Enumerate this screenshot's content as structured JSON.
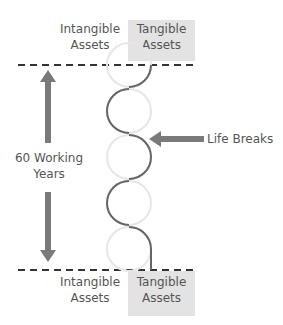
{
  "top_labels": {
    "intangible": [
      "Intangible",
      "Assets"
    ],
    "tangible": [
      "Tangible",
      "Assets"
    ]
  },
  "bottom_labels": {
    "intangible": [
      "Intangible",
      "Assets"
    ],
    "tangible": [
      "Tangible",
      "Assets"
    ]
  },
  "side_label": [
    "60 Working",
    "Years"
  ],
  "pointer_label": "Life Breaks",
  "colors": {
    "tangible_fill": "#e3e3e3",
    "arrow": "#7a7a7a",
    "dark_arc": "#666666",
    "light_arc": "#e6e6e6",
    "dash": "#333333"
  }
}
